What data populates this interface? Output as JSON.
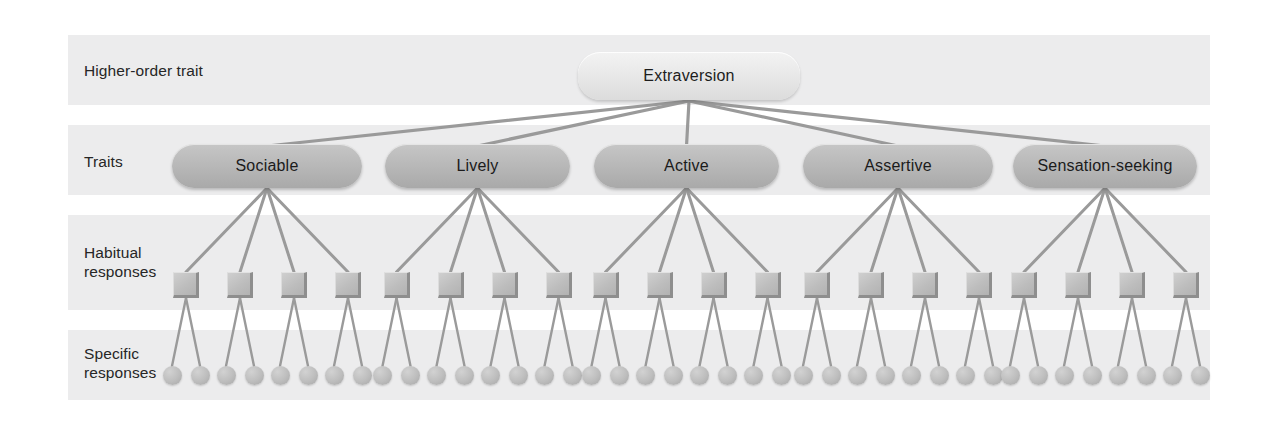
{
  "figure": {
    "type": "hierarchy-diagram",
    "levels": 4
  },
  "rows": [
    {
      "id": "higher-order",
      "label": "Higher-order trait"
    },
    {
      "id": "traits",
      "label": "Traits"
    },
    {
      "id": "habitual",
      "label": "Habitual\nresponses"
    },
    {
      "id": "specific",
      "label": "Specific\nresponses"
    }
  ],
  "root": {
    "label": "Extraversion",
    "x": 578,
    "y": 52,
    "width": 222,
    "height": 48
  },
  "traits": [
    {
      "label": "Sociable",
      "x": 172,
      "width": 190,
      "cx": 267
    },
    {
      "label": "Lively",
      "x": 385,
      "width": 185,
      "cx": 477.5
    },
    {
      "label": "Active",
      "x": 594,
      "width": 185,
      "cx": 686.5
    },
    {
      "label": "Assertive",
      "x": 803,
      "width": 190,
      "cx": 898
    },
    {
      "label": "Sensation-seeking",
      "x": 1013,
      "width": 184,
      "cx": 1105
    }
  ],
  "counts": {
    "traits": 5,
    "habitual_per_trait": 4,
    "specific_per_habitual": 2,
    "habitual_total": 20,
    "specific_total": 40
  },
  "geometry": {
    "habitual_y": 272,
    "specific_y": 366,
    "habitual_spacing": 54,
    "habitual_group_offset": -81,
    "specific_offset": 14,
    "root_fan_origin_x": 689,
    "root_fan_origin_y": 101,
    "trait_node_top_y": 144,
    "trait_node_bottom_y": 188
  },
  "colors": {
    "page_background": "#ffffff",
    "band": "#ececed",
    "root_node": "#e8e8e8",
    "trait_node": "#b9b9b9",
    "habitual_node": "#bdbdbd",
    "specific_node": "#bdbdbd",
    "connector": "#9a9a9a",
    "label_text": "#262626",
    "node_text": "#1b1b1b"
  }
}
